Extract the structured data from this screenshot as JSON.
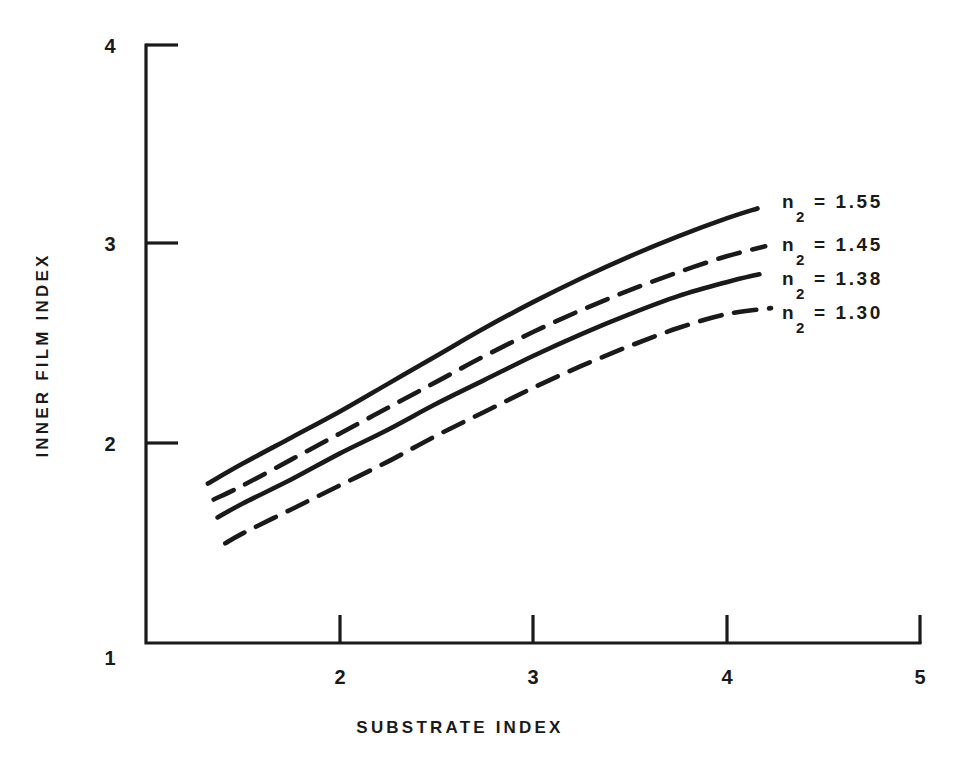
{
  "chart_data": {
    "type": "line",
    "title": "",
    "xlabel": "SUBSTRATE INDEX",
    "ylabel": "INNER FILM INDEX",
    "xlim": [
      1,
      5
    ],
    "ylim": [
      1,
      4
    ],
    "xticks": [
      "1",
      "2",
      "3",
      "4",
      "5"
    ],
    "yticks": [
      "1",
      "2",
      "3",
      "4"
    ],
    "xtick_values": [
      1,
      2,
      3,
      4,
      5
    ],
    "ytick_values": [
      1,
      2,
      3,
      4
    ],
    "grid": false,
    "legend_position": "right-inside",
    "series": [
      {
        "name": "n_2 = 1.55",
        "label_main": "n",
        "label_sub": "2",
        "label_rest": "=  1.55",
        "style": "solid",
        "x": [
          1.32,
          1.5,
          1.75,
          2.0,
          2.25,
          2.5,
          2.75,
          3.0,
          3.25,
          3.5,
          3.75,
          4.0,
          4.16
        ],
        "y": [
          1.8,
          1.9,
          2.03,
          2.16,
          2.3,
          2.44,
          2.58,
          2.71,
          2.83,
          2.94,
          3.04,
          3.13,
          3.18
        ]
      },
      {
        "name": "n_2 = 1.45",
        "label_main": "n",
        "label_sub": "2",
        "label_rest": "=  1.45",
        "style": "dashed",
        "x": [
          1.35,
          1.5,
          1.75,
          2.0,
          2.25,
          2.5,
          2.75,
          3.0,
          3.25,
          3.5,
          3.75,
          4.0,
          4.2
        ],
        "y": [
          1.72,
          1.79,
          1.92,
          2.05,
          2.18,
          2.31,
          2.44,
          2.56,
          2.67,
          2.77,
          2.86,
          2.94,
          2.99
        ]
      },
      {
        "name": "n_2 = 1.38",
        "label_main": "n",
        "label_sub": "2",
        "label_rest": "=  1.38",
        "style": "solid",
        "x": [
          1.37,
          1.5,
          1.75,
          2.0,
          2.25,
          2.5,
          2.75,
          3.0,
          3.25,
          3.5,
          3.75,
          4.0,
          4.17
        ],
        "y": [
          1.63,
          1.7,
          1.82,
          1.95,
          2.07,
          2.2,
          2.32,
          2.44,
          2.55,
          2.65,
          2.74,
          2.81,
          2.85
        ]
      },
      {
        "name": "n_2 = 1.30",
        "label_main": "n",
        "label_sub": "2",
        "label_rest": "=  1.30",
        "style": "dashed",
        "x": [
          1.41,
          1.5,
          1.75,
          2.0,
          2.25,
          2.5,
          2.75,
          3.0,
          3.25,
          3.5,
          3.75,
          4.0,
          4.23
        ],
        "y": [
          1.5,
          1.55,
          1.67,
          1.79,
          1.91,
          2.04,
          2.16,
          2.28,
          2.39,
          2.49,
          2.58,
          2.65,
          2.68
        ]
      }
    ]
  },
  "axes": {
    "x_title": "SUBSTRATE INDEX",
    "y_title": "INNER FILM INDEX",
    "x_tick_labels": [
      "1",
      "2",
      "3",
      "4",
      "5"
    ],
    "y_tick_labels": [
      "4",
      "3",
      "2",
      "1"
    ]
  },
  "legend": {
    "entries": [
      {
        "var": "n",
        "sub": "2",
        "rest": "=  1.55"
      },
      {
        "var": "n",
        "sub": "2",
        "rest": "=  1.45"
      },
      {
        "var": "n",
        "sub": "2",
        "rest": "=  1.38"
      },
      {
        "var": "n",
        "sub": "2",
        "rest": "=  1.30"
      }
    ]
  },
  "colors": {
    "ink": "#1a1a1a",
    "background": "#ffffff"
  }
}
